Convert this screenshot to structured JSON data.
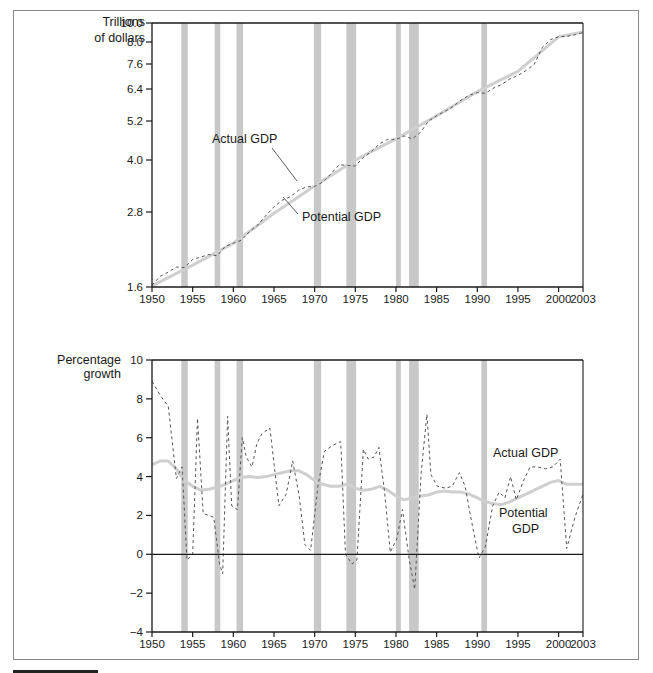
{
  "chart_data": [
    {
      "type": "line",
      "title": "",
      "ylabel": "Trillions of dollars",
      "ylabel_lines": [
        "Trillions",
        "of dollars"
      ],
      "xlabel": "",
      "yscale": "log",
      "ylim": [
        1.6,
        10.0
      ],
      "xlim": [
        1950,
        2003
      ],
      "yticks": [
        1.6,
        2.8,
        4.0,
        5.2,
        6.4,
        7.6,
        8.0,
        10.0
      ],
      "ytick_labels": [
        "1.6",
        "2.8",
        "4.0",
        "5.2",
        "6.4",
        "7.6",
        "8.0",
        "10.0"
      ],
      "xticks": [
        1950,
        1955,
        1960,
        1965,
        1970,
        1975,
        1980,
        1985,
        1990,
        1995,
        2000,
        2003
      ],
      "xtick_labels": [
        "1950",
        "1955",
        "1960",
        "1965",
        "1970",
        "1975",
        "1980",
        "1985",
        "1990",
        "1995",
        "2000",
        "2003"
      ],
      "grid": false,
      "legend": "inline annotations",
      "annotations": [
        "Actual GDP",
        "Potential GDP"
      ],
      "recession_bands": [
        [
          1953.6,
          1954.4
        ],
        [
          1957.7,
          1958.4
        ],
        [
          1960.4,
          1961.2
        ],
        [
          1969.9,
          1970.8
        ],
        [
          1973.9,
          1975.1
        ],
        [
          1980.0,
          1980.6
        ],
        [
          1981.6,
          1982.8
        ],
        [
          1990.5,
          1991.2
        ]
      ],
      "series": [
        {
          "name": "Actual GDP",
          "style": "dashed",
          "x": [
            1950,
            1951,
            1952,
            1953,
            1954,
            1955,
            1956,
            1957,
            1958,
            1959,
            1960,
            1961,
            1962,
            1963,
            1964,
            1965,
            1966,
            1967,
            1968,
            1969,
            1970,
            1971,
            1972,
            1973,
            1974,
            1975,
            1976,
            1977,
            1978,
            1979,
            1980,
            1981,
            1982,
            1983,
            1984,
            1985,
            1986,
            1987,
            1988,
            1989,
            1990,
            1991,
            1992,
            1993,
            1994,
            1995,
            1996,
            1997,
            1998,
            1999,
            2000,
            2001,
            2002,
            2003
          ],
          "values": [
            1.63,
            1.77,
            1.84,
            1.92,
            1.91,
            2.04,
            2.08,
            2.12,
            2.1,
            2.25,
            2.3,
            2.35,
            2.49,
            2.59,
            2.74,
            2.92,
            3.07,
            3.15,
            3.3,
            3.38,
            3.39,
            3.49,
            3.68,
            3.89,
            3.88,
            3.86,
            4.08,
            4.27,
            4.5,
            4.64,
            4.63,
            4.74,
            4.65,
            4.85,
            5.2,
            5.39,
            5.56,
            5.74,
            5.98,
            6.17,
            6.26,
            6.24,
            6.44,
            6.62,
            6.88,
            7.05,
            7.29,
            7.58,
            7.9,
            8.24,
            8.56,
            8.6,
            8.76,
            9.0
          ]
        },
        {
          "name": "Potential GDP",
          "style": "solid-light",
          "x": [
            1950,
            1955,
            1960,
            1965,
            1970,
            1975,
            1980,
            1985,
            1990,
            1995,
            2000,
            2003
          ],
          "values": [
            1.62,
            1.95,
            2.3,
            2.78,
            3.4,
            4.0,
            4.65,
            5.4,
            6.3,
            7.25,
            8.55,
            9.05
          ]
        }
      ]
    },
    {
      "type": "line",
      "title": "",
      "ylabel": "Percentage growth",
      "ylabel_lines": [
        "Percentage",
        "growth"
      ],
      "xlabel": "",
      "ylim": [
        -4,
        10
      ],
      "xlim": [
        1950,
        2003
      ],
      "yticks": [
        -4,
        -2,
        0,
        2,
        4,
        6,
        8,
        10
      ],
      "ytick_labels": [
        "−4",
        "−2",
        "0",
        "2",
        "4",
        "6",
        "8",
        "10"
      ],
      "xticks": [
        1950,
        1955,
        1960,
        1965,
        1970,
        1975,
        1980,
        1985,
        1990,
        1995,
        2000,
        2003
      ],
      "xtick_labels": [
        "1950",
        "1955",
        "1960",
        "1965",
        "1970",
        "1975",
        "1980",
        "1985",
        "1990",
        "1995",
        "2000",
        "2003"
      ],
      "grid": false,
      "zero_line": true,
      "legend": "inline annotations",
      "annotations": [
        "Actual GDP",
        "Potential GDP"
      ],
      "recession_bands": [
        [
          1953.6,
          1954.4
        ],
        [
          1957.7,
          1958.4
        ],
        [
          1960.4,
          1961.2
        ],
        [
          1969.9,
          1970.8
        ],
        [
          1973.9,
          1975.1
        ],
        [
          1980.0,
          1980.6
        ],
        [
          1981.6,
          1982.8
        ],
        [
          1990.5,
          1991.2
        ]
      ],
      "series": [
        {
          "name": "Actual GDP",
          "style": "dashed",
          "x": [
            1950,
            1951,
            1952,
            1953,
            1953.7,
            1954.3,
            1955,
            1955.6,
            1956.3,
            1957,
            1957.6,
            1958.3,
            1958.7,
            1959.3,
            1959.8,
            1960.5,
            1961.1,
            1961.6,
            1962.3,
            1962.9,
            1963.5,
            1964.5,
            1965.6,
            1966.5,
            1967.3,
            1968.1,
            1968.8,
            1969.5,
            1970.4,
            1971.2,
            1972.2,
            1973.2,
            1973.8,
            1974.6,
            1975.2,
            1976,
            1976.6,
            1977.3,
            1977.9,
            1978.6,
            1979.3,
            1980.1,
            1980.8,
            1981.6,
            1982.3,
            1983.1,
            1983.8,
            1984.3,
            1985.1,
            1986.1,
            1986.9,
            1987.8,
            1988.5,
            1989.2,
            1990.2,
            1991,
            1991.9,
            1992.7,
            1993.4,
            1994.1,
            1994.8,
            1995.6,
            1996.5,
            1997.4,
            1998.4,
            1999.3,
            2000.2,
            2001,
            2002,
            2003
          ],
          "values": [
            8.9,
            8.2,
            7.6,
            3.9,
            4.5,
            -0.3,
            0.0,
            7.0,
            2.1,
            2.0,
            1.9,
            -0.5,
            -1.0,
            7.1,
            2.5,
            2.3,
            6.0,
            5.0,
            4.5,
            5.7,
            6.2,
            6.5,
            2.5,
            3.1,
            4.8,
            3.0,
            0.5,
            0.2,
            3.5,
            5.3,
            5.6,
            5.8,
            0.0,
            -0.5,
            -0.3,
            5.4,
            4.9,
            5.0,
            5.5,
            3.2,
            0.1,
            0.8,
            2.3,
            -0.2,
            -1.8,
            4.2,
            7.2,
            4.1,
            3.5,
            3.4,
            3.5,
            4.2,
            3.5,
            1.9,
            -0.2,
            0.4,
            2.5,
            3.2,
            2.9,
            4.0,
            2.8,
            3.7,
            4.5,
            4.5,
            4.4,
            4.5,
            4.9,
            0.3,
            1.9,
            3.1
          ]
        },
        {
          "name": "Potential GDP",
          "style": "solid-light",
          "x": [
            1950,
            1951,
            1952,
            1953,
            1954,
            1955,
            1956,
            1957,
            1958,
            1959,
            1960,
            1961,
            1962,
            1963,
            1964,
            1965,
            1966,
            1967,
            1968,
            1969,
            1970,
            1971,
            1972,
            1973,
            1974,
            1975,
            1976,
            1977,
            1978,
            1979,
            1980,
            1981,
            1982,
            1983,
            1984,
            1985,
            1986,
            1987,
            1988,
            1989,
            1990,
            1991,
            1992,
            1993,
            1994,
            1995,
            1996,
            1997,
            1998,
            1999,
            2000,
            2001,
            2002,
            2003
          ],
          "values": [
            4.6,
            4.8,
            4.8,
            4.4,
            3.8,
            3.5,
            3.3,
            3.35,
            3.45,
            3.6,
            3.8,
            3.95,
            4.0,
            3.95,
            4.0,
            4.1,
            4.2,
            4.3,
            4.3,
            4.1,
            3.8,
            3.6,
            3.5,
            3.5,
            3.6,
            3.4,
            3.3,
            3.35,
            3.5,
            3.3,
            3.0,
            2.8,
            2.9,
            3.0,
            3.05,
            3.2,
            3.25,
            3.2,
            3.2,
            3.1,
            2.9,
            2.7,
            2.6,
            2.55,
            2.7,
            2.9,
            3.1,
            3.3,
            3.5,
            3.7,
            3.8,
            3.6,
            3.6,
            3.6
          ]
        }
      ]
    }
  ],
  "top_chart": {
    "ylabel_line1": "Trillions",
    "ylabel_line2": "of dollars",
    "annot_actual": "Actual GDP",
    "annot_potential": "Potential GDP"
  },
  "bottom_chart": {
    "ylabel_line1": "Percentage",
    "ylabel_line2": "growth",
    "annot_actual": "Actual GDP",
    "annot_potential_line1": "Potential",
    "annot_potential_line2": "GDP"
  },
  "colors": {
    "recession_band": "#c8c8c8",
    "potential_line": "#cfcfcf",
    "actual_line": "#555555",
    "axis": "#1a1a1a"
  }
}
